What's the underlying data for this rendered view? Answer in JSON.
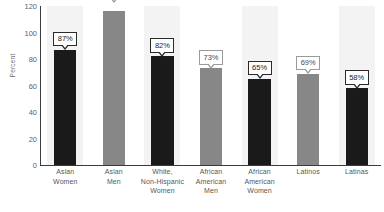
{
  "chart_data": {
    "type": "bar",
    "title": "",
    "xlabel": "",
    "ylabel": "Percent",
    "ylim": [
      0,
      120
    ],
    "yticks": [
      0,
      20,
      40,
      60,
      80,
      100,
      120
    ],
    "ytick_labels": [
      "0",
      "20",
      "40",
      "60",
      "80",
      "100",
      "120"
    ],
    "grid": false,
    "legend": "none",
    "categories": [
      "Asian Women",
      "Asian Men",
      "White, Non-Hispanic Women",
      "African American Men",
      "African American Women",
      "Latinos",
      "Latinas"
    ],
    "category_lines": [
      [
        "Asian",
        "Women"
      ],
      [
        "Asian",
        "Men"
      ],
      [
        "White,",
        "Non-Hispanic",
        "Women"
      ],
      [
        "African",
        "American",
        "Men"
      ],
      [
        "African",
        "American",
        "Women"
      ],
      [
        "Latinos"
      ],
      [
        "Latinas"
      ]
    ],
    "values": [
      87,
      116,
      82,
      73,
      65,
      69,
      58
    ],
    "data_labels": [
      "87%",
      null,
      "82%",
      "73%",
      "65%",
      "69%",
      "58%"
    ],
    "bar_colors": [
      "#1a1a1a",
      "#878787",
      "#1a1a1a",
      "#878787",
      "#1a1a1a",
      "#878787",
      "#1a1a1a"
    ]
  },
  "colors": {
    "bar_dark": "#1a1a1a",
    "bar_gray": "#878787",
    "axis": "#3b3b3b",
    "stripe": "#f3f3f3",
    "background": "#ffffff",
    "tick_text": "#5f5f5f",
    "label_text": "#575757"
  }
}
